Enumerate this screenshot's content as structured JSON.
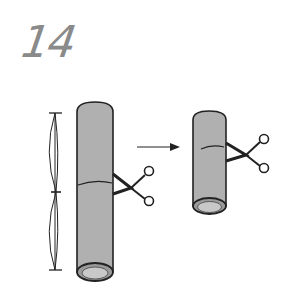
{
  "step": {
    "number": "14"
  },
  "illustration": {
    "description": "Measure tube length, cut in half with scissors, resulting shorter tube",
    "colors": {
      "tube_fill": "#b0b0b0",
      "outline": "#222222",
      "number": "#8a8a8a"
    },
    "icons": [
      "measure-bracket-icon",
      "tube-long-icon",
      "scissors-icon",
      "arrow-right-icon",
      "tube-short-icon"
    ]
  }
}
